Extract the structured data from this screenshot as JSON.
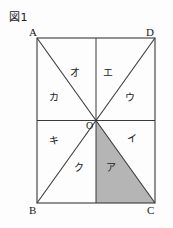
{
  "figure": {
    "caption": "図1",
    "background_color": "#fdfdfd",
    "line_color": "#333333",
    "shade_color": "#b5b5b5"
  },
  "corners": {
    "top_left": "A",
    "top_right": "D",
    "bottom_left": "B",
    "bottom_right": "C",
    "center": "O"
  },
  "regions": [
    {
      "key": "o",
      "label": "オ"
    },
    {
      "key": "e",
      "label": "エ"
    },
    {
      "key": "ka",
      "label": "カ"
    },
    {
      "key": "u",
      "label": "ウ"
    },
    {
      "key": "ki",
      "label": "キ"
    },
    {
      "key": "i",
      "label": "イ"
    },
    {
      "key": "ku",
      "label": "ク"
    },
    {
      "key": "a",
      "label": "ア"
    }
  ],
  "geometry": {
    "rect": {
      "left": 37,
      "top": 38,
      "right": 155,
      "bottom": 203
    },
    "center_point": {
      "x": 96,
      "y": 120.5
    },
    "shaded_region": "ア",
    "shaded_triangle_points": "96,120.5 96,203 155,203"
  }
}
